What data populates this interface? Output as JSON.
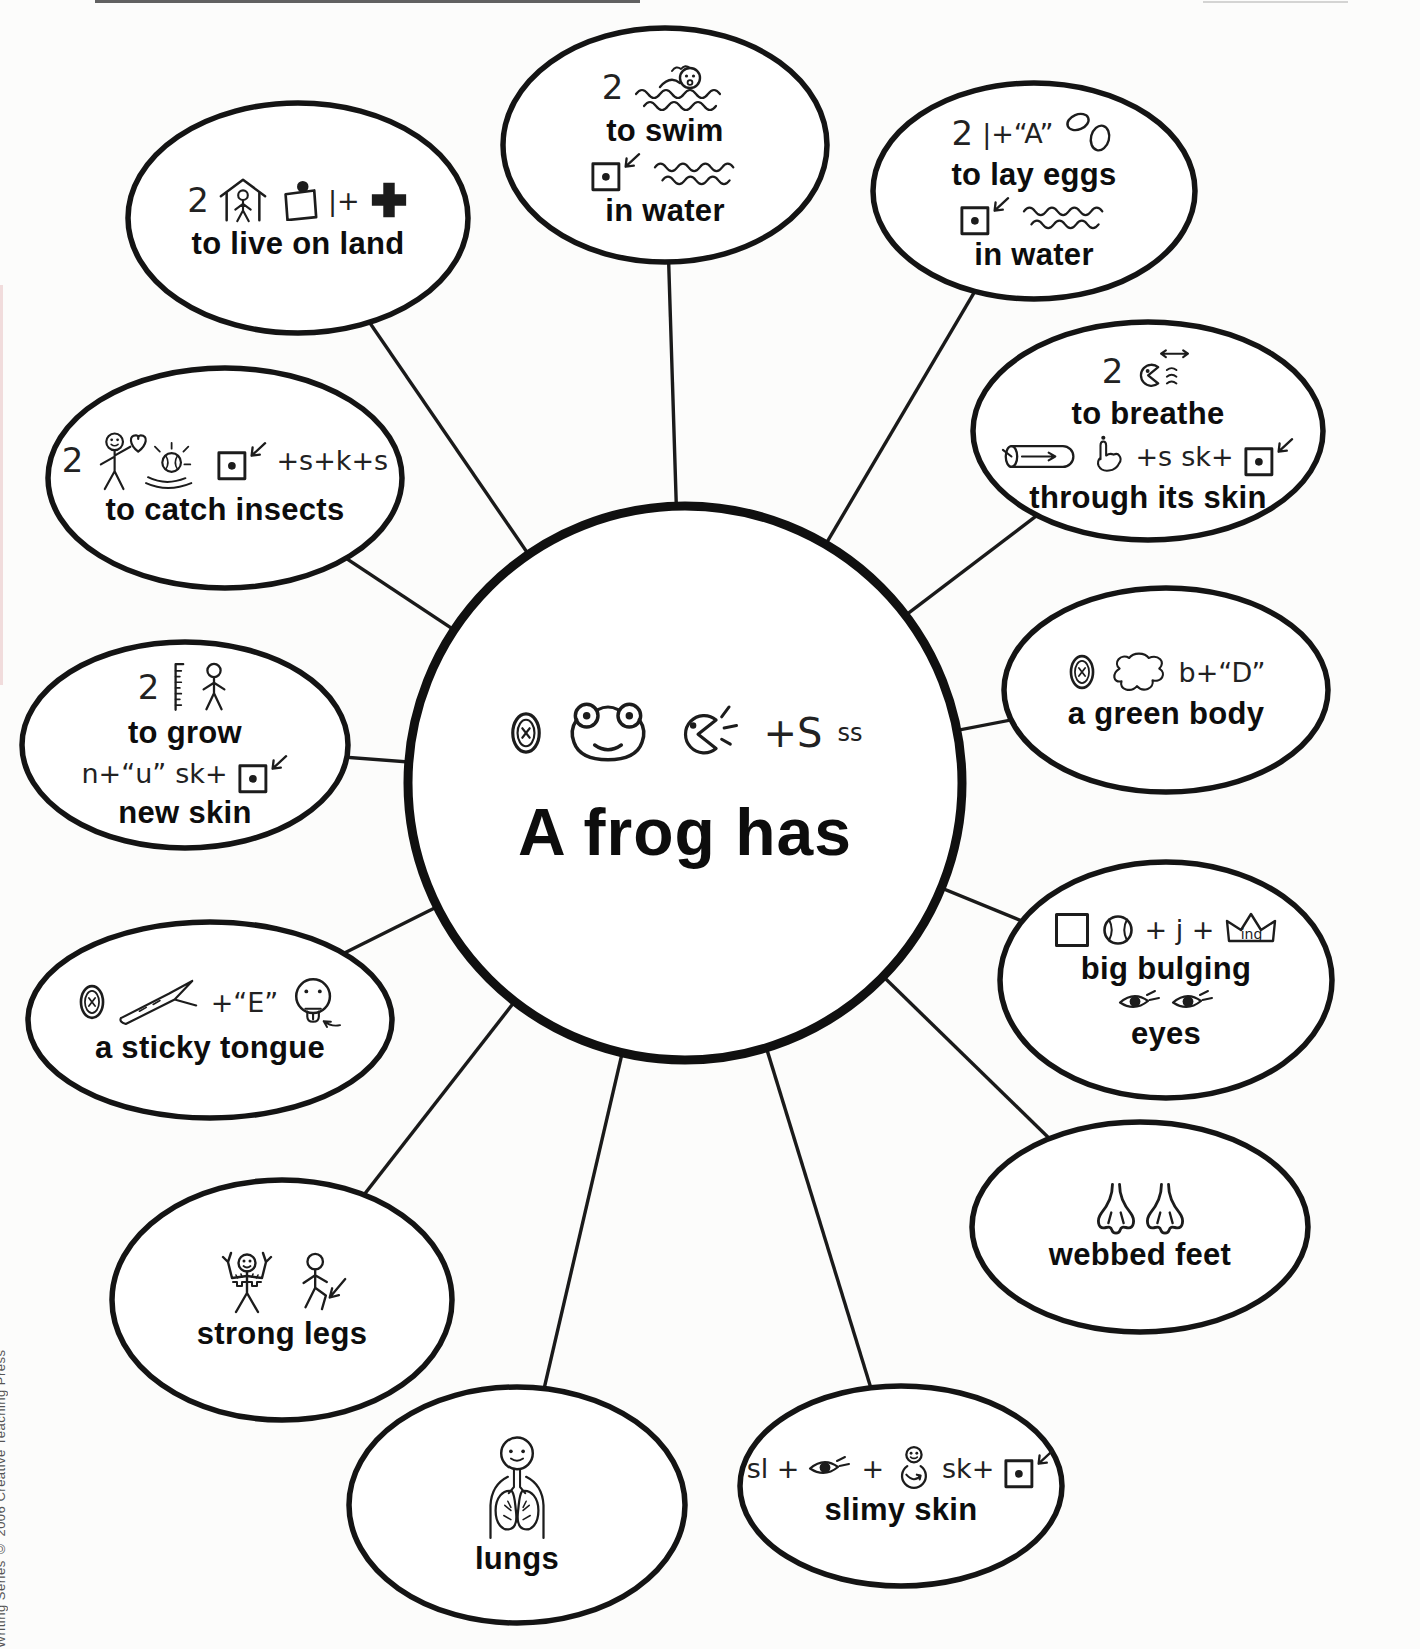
{
  "page": {
    "side_caption": "Writing Series © 2006 Creative Teaching Press"
  },
  "center": {
    "id": "a-frog-has",
    "rows": [
      {
        "segs": [
          {
            "k": "i",
            "v": "oval-x"
          },
          {
            "k": "i",
            "v": "frog"
          },
          {
            "k": "i",
            "v": "speak"
          },
          {
            "k": "t",
            "v": "+S"
          },
          {
            "k": "t",
            "v": "ss",
            "sup": true
          }
        ]
      },
      {
        "label": "A frog has"
      }
    ]
  },
  "bubbles": [
    {
      "id": "swim",
      "rows": [
        {
          "segs": [
            {
              "k": "t",
              "v": "2"
            },
            {
              "k": "i",
              "v": "swimmer"
            }
          ]
        },
        {
          "label": "to swim"
        },
        {
          "segs": [
            {
              "k": "i",
              "v": "boxdot-arrow"
            },
            {
              "k": "i",
              "v": "waves"
            }
          ]
        },
        {
          "label": "in water"
        }
      ]
    },
    {
      "id": "lay-eggs",
      "rows": [
        {
          "segs": [
            {
              "k": "t",
              "v": "2"
            },
            {
              "k": "t",
              "v": "|+“A”"
            },
            {
              "k": "i",
              "v": "eggs"
            }
          ]
        },
        {
          "label": "to lay eggs"
        },
        {
          "segs": [
            {
              "k": "i",
              "v": "boxdot-arrow"
            },
            {
              "k": "i",
              "v": "waves"
            }
          ]
        },
        {
          "label": "in water"
        }
      ]
    },
    {
      "id": "breathe",
      "rows": [
        {
          "segs": [
            {
              "k": "t",
              "v": "2"
            },
            {
              "k": "i",
              "v": "breathe-face"
            }
          ]
        },
        {
          "label": "to breathe"
        },
        {
          "segs": [
            {
              "k": "i",
              "v": "tube"
            },
            {
              "k": "i",
              "v": "hand"
            },
            {
              "k": "t",
              "v": "+s"
            },
            {
              "k": "t",
              "v": "sk+"
            },
            {
              "k": "i",
              "v": "boxdot-arrow"
            }
          ]
        },
        {
          "label": "through its skin"
        }
      ]
    },
    {
      "id": "green-body",
      "rows": [
        {
          "segs": [
            {
              "k": "i",
              "v": "oval-x"
            },
            {
              "k": "i",
              "v": "blob"
            },
            {
              "k": "t",
              "v": "b+“D”"
            }
          ]
        },
        {
          "label": "a green body"
        }
      ]
    },
    {
      "id": "bulging-eyes",
      "rows": [
        {
          "segs": [
            {
              "k": "i",
              "v": "square"
            },
            {
              "k": "i",
              "v": "ball"
            },
            {
              "k": "t",
              "v": "+ j +"
            },
            {
              "k": "it",
              "v": "crown",
              "t": "ing"
            }
          ]
        },
        {
          "label": "big bulging"
        },
        {
          "segs": [
            {
              "k": "i",
              "v": "eye"
            },
            {
              "k": "i",
              "v": "eye"
            }
          ]
        },
        {
          "label": "eyes"
        }
      ]
    },
    {
      "id": "webbed-feet",
      "rows": [
        {
          "segs": [
            {
              "k": "i",
              "v": "webfoot"
            },
            {
              "k": "i",
              "v": "webfoot"
            }
          ]
        },
        {
          "label": "webbed feet"
        }
      ]
    },
    {
      "id": "slimy-skin",
      "rows": [
        {
          "segs": [
            {
              "k": "t",
              "v": "sl +"
            },
            {
              "k": "i",
              "v": "eye"
            },
            {
              "k": "t",
              "v": "+"
            },
            {
              "k": "i",
              "v": "person-round"
            },
            {
              "k": "t",
              "v": "sk+"
            },
            {
              "k": "i",
              "v": "boxdot-arrow"
            }
          ]
        },
        {
          "label": "slimy skin"
        }
      ]
    },
    {
      "id": "lungs",
      "rows": [
        {
          "segs": [
            {
              "k": "i",
              "v": "lungs-person"
            }
          ]
        },
        {
          "label": "lungs"
        }
      ]
    },
    {
      "id": "strong-legs",
      "rows": [
        {
          "segs": [
            {
              "k": "i",
              "v": "strongman"
            },
            {
              "k": "i",
              "v": "stickfig-arrow"
            }
          ]
        },
        {
          "label": "strong legs"
        }
      ]
    },
    {
      "id": "sticky-tongue",
      "rows": [
        {
          "segs": [
            {
              "k": "i",
              "v": "oval-x"
            },
            {
              "k": "i",
              "v": "branch"
            },
            {
              "k": "t",
              "v": "+“E”"
            },
            {
              "k": "i",
              "v": "tongue-face"
            }
          ]
        },
        {
          "label": "a sticky tongue"
        }
      ]
    },
    {
      "id": "grow-new-skin",
      "rows": [
        {
          "segs": [
            {
              "k": "t",
              "v": "2"
            },
            {
              "k": "i",
              "v": "ruler"
            },
            {
              "k": "i",
              "v": "stickfig"
            }
          ]
        },
        {
          "label": "to grow"
        },
        {
          "segs": [
            {
              "k": "t",
              "v": "n+“u”"
            },
            {
              "k": "t",
              "v": "sk+"
            },
            {
              "k": "i",
              "v": "boxdot-arrow"
            }
          ]
        },
        {
          "label": "new skin"
        }
      ]
    },
    {
      "id": "catch-insects",
      "rows": [
        {
          "segs": [
            {
              "k": "t",
              "v": "2"
            },
            {
              "k": "i",
              "v": "catcher"
            },
            {
              "k": "i",
              "v": "boxdot-arrow"
            },
            {
              "k": "t",
              "v": "+s+k+s"
            }
          ]
        },
        {
          "label": "to catch insects"
        }
      ]
    },
    {
      "id": "live-on-land",
      "rows": [
        {
          "segs": [
            {
              "k": "t",
              "v": "2"
            },
            {
              "k": "i",
              "v": "house-person"
            },
            {
              "k": "i",
              "v": "boxknob"
            },
            {
              "k": "t",
              "v": "|+"
            },
            {
              "k": "i",
              "v": "crossplus"
            }
          ]
        },
        {
          "label": "to live on land"
        }
      ]
    }
  ]
}
